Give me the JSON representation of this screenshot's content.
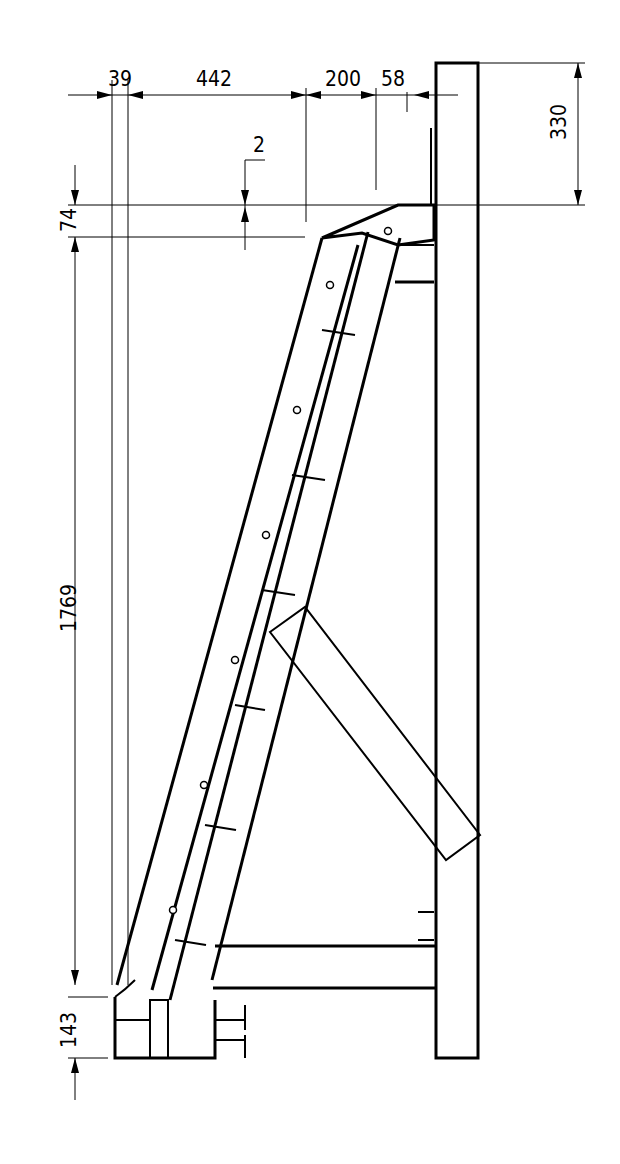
{
  "drawing": {
    "type": "technical-elevation",
    "subject": "stair stringer with platform, side view",
    "dimensions": {
      "top_horizontal": [
        {
          "label": "39"
        },
        {
          "label": "442"
        },
        {
          "label": "200"
        },
        {
          "label": "58"
        }
      ],
      "right_vertical": {
        "label": "330"
      },
      "left_vertical": [
        {
          "label": "74"
        },
        {
          "label": "1769"
        },
        {
          "label": "143"
        }
      ],
      "offset_note": {
        "label": "2"
      }
    },
    "steps": {
      "count": 6
    },
    "colors": {
      "line": "#000000",
      "background": "#ffffff"
    }
  }
}
